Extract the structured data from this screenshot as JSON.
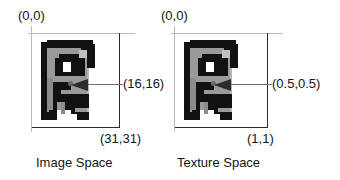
{
  "figure": {
    "panels": [
      {
        "id": "image-space",
        "caption": "Image Space",
        "origin_label": "(0,0)",
        "center_label": "(16,16)",
        "extent_label": "(31,31)"
      },
      {
        "id": "texture-space",
        "caption": "Texture Space",
        "origin_label": "(0,0)",
        "center_label": "(0.5,0.5)",
        "extent_label": "(1,1)"
      }
    ]
  },
  "colors": {
    "background": "#ffffff",
    "guide_line": "#b9b9b9",
    "axis_line": "#2b2b2b",
    "leader_line": "#6e6e6e",
    "text": "#141414",
    "sprite_dark": "#111111",
    "sprite_mid": "#8c8c8c",
    "sprite_light": "#b4b4b4",
    "sprite_white": "#ffffff",
    "center_dot": "#6a6a6a"
  },
  "sprite": {
    "name": "letter-b-pixel-bitmap",
    "grid": 32,
    "description": "32x32 grayscale bitmap of a blocky letter-B style glyph"
  }
}
